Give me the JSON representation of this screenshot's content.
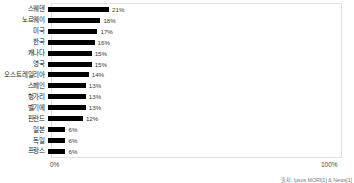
{
  "chart_data": {
    "type": "bar",
    "orientation": "horizontal",
    "title": "",
    "xlabel": "",
    "ylabel": "",
    "xlim": [
      0,
      100
    ],
    "grid": false,
    "legend": null,
    "bar_color": "#000000",
    "frame_color": "#e2e2e2",
    "axis_ticks": [
      "0%",
      "100%"
    ],
    "categories": [
      "스웨덴",
      "노르웨이",
      "미국",
      "한국",
      "캐나다",
      "영국",
      "오스트레일리아",
      "스페인",
      "헝가리",
      "벨기에",
      "핀란드",
      "일본",
      "독일",
      "프랑스"
    ],
    "values": [
      21,
      18,
      17,
      16,
      15,
      15,
      14,
      13,
      13,
      13,
      12,
      6,
      6,
      6
    ],
    "value_labels": [
      "21%",
      "18%",
      "17%",
      "16%",
      "15%",
      "15%",
      "14%",
      "13%",
      "13%",
      "13%",
      "12%",
      "6%",
      "6%",
      "6%"
    ]
  },
  "axis": {
    "min_label": "0%",
    "max_label": "100%"
  },
  "footer": {
    "source": "출처: Ipsos MORI[1] & News[1]"
  }
}
